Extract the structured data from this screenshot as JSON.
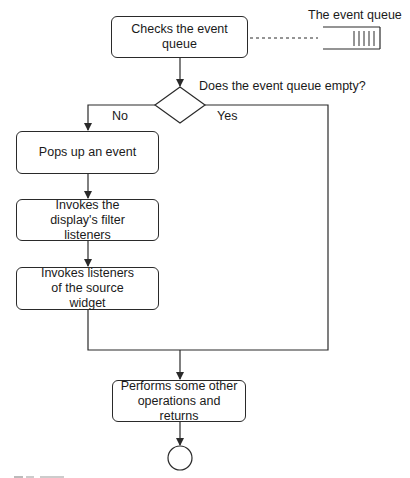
{
  "diagram": {
    "type": "flowchart",
    "nodes": {
      "check_queue": {
        "label": "Checks the event queue",
        "shape": "rounded-rect"
      },
      "decision": {
        "label": "Does the event queue empty?",
        "shape": "diamond"
      },
      "pop_event": {
        "label": "Pops up an event",
        "shape": "rounded-rect"
      },
      "filter_listeners": {
        "label": "Invokes the display's filter listeners",
        "shape": "rounded-rect"
      },
      "source_listeners": {
        "label": "Invokes listeners of the source widget",
        "shape": "rounded-rect"
      },
      "other_ops": {
        "label": "Performs some other operations and returns",
        "shape": "rounded-rect"
      },
      "end": {
        "label": "",
        "shape": "circle"
      }
    },
    "queue": {
      "label": "The event queue",
      "slots": 5
    },
    "branches": {
      "no_label": "No",
      "yes_label": "Yes"
    },
    "edges": [
      {
        "from": "check_queue",
        "to": "decision"
      },
      {
        "from": "decision",
        "to": "pop_event",
        "label": "No"
      },
      {
        "from": "decision",
        "to": "other_ops",
        "label": "Yes"
      },
      {
        "from": "pop_event",
        "to": "filter_listeners"
      },
      {
        "from": "filter_listeners",
        "to": "source_listeners"
      },
      {
        "from": "source_listeners",
        "to": "other_ops"
      },
      {
        "from": "other_ops",
        "to": "end"
      },
      {
        "from": "check_queue",
        "to": "queue",
        "style": "dashed"
      }
    ],
    "colors": {
      "stroke": "#2a2a2a",
      "background": "#ffffff",
      "text": "#1a1a1a"
    }
  }
}
